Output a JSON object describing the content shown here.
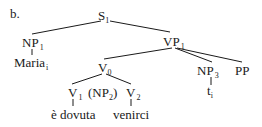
{
  "example_label": "b.",
  "nodes": {
    "s": {
      "cat": "S",
      "sub": "1"
    },
    "np1": {
      "cat": "NP",
      "sub": "1"
    },
    "maria": {
      "word": "Maria",
      "sub": "i"
    },
    "vp1": {
      "cat": "VP",
      "sub": "1"
    },
    "v0": {
      "cat": "V",
      "sub": "0"
    },
    "v1": {
      "cat": "V",
      "sub": "1"
    },
    "np2": {
      "open": "(NP",
      "sub": "2",
      "close": ")"
    },
    "v2": {
      "cat": "V",
      "sub": "2"
    },
    "e_dovuta": {
      "word": "è dovuta"
    },
    "venirci": {
      "word": "venirci"
    },
    "np3": {
      "cat": "NP",
      "sub": "3"
    },
    "trace": {
      "word": "t",
      "sub": "i"
    },
    "pp": {
      "cat": "PP"
    }
  }
}
